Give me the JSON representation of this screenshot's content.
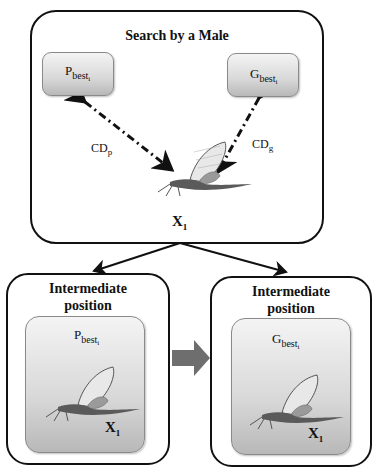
{
  "diagram": {
    "top_box": {
      "title": "Search by a Male",
      "pbest_box": {
        "base": "P",
        "sub": "best",
        "subsub": "i"
      },
      "gbest_box": {
        "base": "G",
        "sub": "best",
        "subsub": "i"
      },
      "cdp_label": {
        "base": "CD",
        "sub": "p"
      },
      "cdg_label": {
        "base": "CD",
        "sub": "g"
      },
      "position_label": {
        "base": "X",
        "sub": "1"
      },
      "figure": "mayfly-image"
    },
    "left_box": {
      "title_line1": "Intermediate",
      "title_line2": "position",
      "inner_label": {
        "base": "P",
        "sub": "best",
        "subsub": "i"
      },
      "position_label": {
        "base": "X",
        "sub": "1"
      },
      "figure": "mayfly-image"
    },
    "right_box": {
      "title_line1": "Intermediate",
      "title_line2": "position",
      "inner_label": {
        "base": "G",
        "sub": "best",
        "subsub": "i"
      },
      "position_label": {
        "base": "X",
        "sub": "1"
      },
      "figure": "mayfly-image"
    },
    "connectors": {
      "top_to_left": "arrow",
      "top_to_right": "arrow",
      "left_to_right": "block-arrow"
    },
    "colors": {
      "stroke": "#111111",
      "inner_gradient_top": "#f4f4f4",
      "inner_gradient_bottom": "#b8b8b8",
      "block_arrow": "#6e6e6e"
    }
  }
}
